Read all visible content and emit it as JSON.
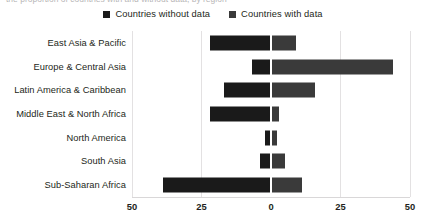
{
  "top_caption": "the proportion of countries with and without data, by region",
  "legend": {
    "items": [
      {
        "label": "Countries without data",
        "color": "#1a1a1a",
        "icon": "square-swatch"
      },
      {
        "label": "Countries with data",
        "color": "#3a3a3a",
        "icon": "square-swatch"
      }
    ]
  },
  "axis": {
    "ticks": [
      {
        "label": "50",
        "value": -50
      },
      {
        "label": "25",
        "value": -25
      },
      {
        "label": "0",
        "value": 0
      },
      {
        "label": "25",
        "value": 25
      },
      {
        "label": "50",
        "value": 50
      }
    ]
  },
  "chart_data": {
    "type": "bar",
    "orientation": "horizontal-diverging",
    "title": "",
    "xlabel": "",
    "ylabel": "",
    "xlim": [
      -50,
      50
    ],
    "grid": true,
    "legend_position": "top-center",
    "categories": [
      "East Asia & Pacific",
      "Europe & Central Asia",
      "Latin America & Caribbean",
      "Middle East & North Africa",
      "North America",
      "South Asia",
      "Sub-Saharan Africa"
    ],
    "series": [
      {
        "name": "Countries without data",
        "color": "#1a1a1a",
        "side": "left",
        "values": [
          22,
          7,
          17,
          22,
          2,
          4,
          39
        ]
      },
      {
        "name": "Countries with data",
        "color": "#3a3a3a",
        "side": "right",
        "values": [
          9,
          44,
          16,
          3,
          2,
          5,
          11
        ]
      }
    ]
  }
}
